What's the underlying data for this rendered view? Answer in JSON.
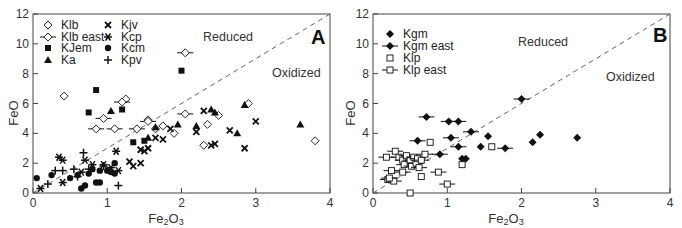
{
  "chart_data": [
    {
      "panel": "A",
      "type": "scatter",
      "title": "",
      "panel_label": "A",
      "xlabel": "Fe2O3",
      "ylabel": "FeO",
      "xlim": [
        0,
        4
      ],
      "ylim": [
        0,
        12
      ],
      "xticks": [
        "0",
        "1",
        "2",
        "3",
        "4"
      ],
      "yticks": [
        "0",
        "2",
        "4",
        "6",
        "8",
        "10",
        "12"
      ],
      "grid": false,
      "legend_position": "upper-left",
      "annotations": [
        {
          "text": "Reduced",
          "x": 2.3,
          "y": 10.6
        },
        {
          "text": "Oxidized",
          "x": 3.15,
          "y": 8.1
        }
      ],
      "reference_line": {
        "style": "dashed",
        "from": [
          0,
          0
        ],
        "to": [
          4,
          12
        ]
      },
      "series": [
        {
          "name": "Klb",
          "marker": "diamond-open",
          "points": [
            [
              0.42,
              6.5
            ],
            [
              1.25,
              6.3
            ],
            [
              1.55,
              4.9
            ],
            [
              1.65,
              4.3
            ],
            [
              1.75,
              4.5
            ],
            [
              1.9,
              4.0
            ],
            [
              2.35,
              4.6
            ],
            [
              2.5,
              5.2
            ],
            [
              2.3,
              3.2
            ],
            [
              2.9,
              6.0
            ],
            [
              3.8,
              3.5
            ]
          ]
        },
        {
          "name": "Klb east",
          "marker": "diamond-open-bar",
          "points": [
            [
              0.85,
              4.3
            ],
            [
              0.95,
              5.0
            ],
            [
              1.1,
              4.3
            ],
            [
              1.2,
              6.1
            ],
            [
              1.4,
              4.3
            ],
            [
              1.55,
              4.8
            ],
            [
              2.05,
              9.4
            ],
            [
              2.05,
              5.3
            ]
          ]
        },
        {
          "name": "KJem",
          "marker": "square-filled",
          "points": [
            [
              0.75,
              5.4
            ],
            [
              0.85,
              6.9
            ],
            [
              1.2,
              5.6
            ],
            [
              2.0,
              8.2
            ],
            [
              1.5,
              3.5
            ],
            [
              1.35,
              3.4
            ]
          ]
        },
        {
          "name": "Ka",
          "marker": "triangle-filled",
          "points": [
            [
              1.05,
              5.5
            ],
            [
              1.55,
              3.7
            ],
            [
              1.65,
              4.4
            ],
            [
              1.95,
              4.6
            ],
            [
              2.2,
              4.5
            ],
            [
              2.4,
              5.6
            ],
            [
              2.45,
              5.4
            ],
            [
              2.85,
              5.9
            ],
            [
              2.75,
              4.0
            ],
            [
              3.6,
              4.6
            ]
          ]
        },
        {
          "name": "Kjv",
          "marker": "x-bold",
          "points": [
            [
              1.3,
              2.1
            ],
            [
              1.35,
              1.8
            ],
            [
              1.45,
              2.0
            ],
            [
              1.45,
              2.9
            ],
            [
              1.5,
              2.8
            ],
            [
              1.55,
              3.0
            ],
            [
              1.65,
              3.7
            ],
            [
              1.75,
              3.6
            ],
            [
              1.85,
              4.3
            ],
            [
              2.2,
              4.1
            ],
            [
              2.3,
              5.5
            ],
            [
              2.45,
              3.3
            ],
            [
              2.4,
              3.2
            ],
            [
              2.65,
              4.2
            ],
            [
              2.85,
              3.0
            ],
            [
              3.0,
              4.8
            ]
          ]
        },
        {
          "name": "Kcp",
          "marker": "asterisk",
          "points": [
            [
              0.1,
              0.3
            ],
            [
              0.35,
              2.4
            ],
            [
              0.4,
              2.2
            ],
            [
              0.4,
              0.7
            ],
            [
              0.65,
              1.4
            ],
            [
              0.7,
              2.2
            ],
            [
              0.8,
              1.9
            ],
            [
              0.95,
              1.9
            ],
            [
              1.05,
              1.7
            ],
            [
              1.12,
              2.8
            ],
            [
              1.15,
              1.5
            ]
          ]
        },
        {
          "name": "Kcm",
          "marker": "circle-filled",
          "points": [
            [
              0.05,
              1.0
            ],
            [
              0.25,
              1.2
            ],
            [
              0.5,
              1.0
            ],
            [
              0.6,
              1.2
            ],
            [
              0.65,
              0.3
            ],
            [
              0.7,
              0.5
            ],
            [
              0.75,
              1.3
            ],
            [
              0.8,
              1.6
            ],
            [
              0.85,
              0.7
            ],
            [
              0.9,
              0.7
            ],
            [
              0.9,
              1.5
            ],
            [
              1.0,
              1.5
            ],
            [
              1.05,
              1.4
            ],
            [
              1.1,
              2.0
            ],
            [
              1.1,
              1.3
            ]
          ]
        },
        {
          "name": "Kpv",
          "marker": "plus",
          "points": [
            [
              0.2,
              0.6
            ],
            [
              0.3,
              1.5
            ],
            [
              0.4,
              1.5
            ],
            [
              0.55,
              1.6
            ],
            [
              0.68,
              2.7
            ],
            [
              0.6,
              1.1
            ],
            [
              1.15,
              0.5
            ],
            [
              0.75,
              1.6
            ],
            [
              0.95,
              1.8
            ]
          ]
        }
      ]
    },
    {
      "panel": "B",
      "type": "scatter",
      "title": "",
      "panel_label": "B",
      "xlabel": "Fe2O3",
      "ylabel": "FeO",
      "xlim": [
        0,
        4
      ],
      "ylim": [
        0,
        12
      ],
      "xticks": [
        "0",
        "1",
        "2",
        "3",
        "4"
      ],
      "yticks": [
        "0",
        "2",
        "4",
        "6",
        "8",
        "10",
        "12"
      ],
      "grid": false,
      "legend_position": "upper-left",
      "annotations": [
        {
          "text": "Reduced",
          "x": 2.15,
          "y": 10.4
        },
        {
          "text": "Oxidized",
          "x": 3.15,
          "y": 7.9
        }
      ],
      "reference_line": {
        "style": "dashed",
        "from": [
          0,
          0
        ],
        "to": [
          4,
          12
        ]
      },
      "series": [
        {
          "name": "Kgm",
          "marker": "diamond-filled",
          "points": [
            [
              1.2,
              2.3
            ],
            [
              1.25,
              2.3
            ],
            [
              1.45,
              3.1
            ],
            [
              1.55,
              3.8
            ],
            [
              2.15,
              3.4
            ],
            [
              2.25,
              3.9
            ],
            [
              2.75,
              3.7
            ]
          ]
        },
        {
          "name": "Kgm east",
          "marker": "diamond-filled-bar",
          "points": [
            [
              0.6,
              3.5
            ],
            [
              0.72,
              5.1
            ],
            [
              0.9,
              2.6
            ],
            [
              1.02,
              4.8
            ],
            [
              1.05,
              3.7
            ],
            [
              1.15,
              4.8
            ],
            [
              1.15,
              3.1
            ],
            [
              1.32,
              4.1
            ],
            [
              1.78,
              3.0
            ],
            [
              2.0,
              6.3
            ]
          ]
        },
        {
          "name": "Klp",
          "marker": "square-open",
          "points": [
            [
              0.5,
              0.0
            ],
            [
              0.65,
              1.1
            ],
            [
              0.77,
              3.4
            ],
            [
              1.2,
              1.9
            ],
            [
              1.6,
              3.1
            ]
          ]
        },
        {
          "name": "Klp east",
          "marker": "square-open-bar",
          "points": [
            [
              0.2,
              0.9
            ],
            [
              0.25,
              1.5
            ],
            [
              0.28,
              0.8
            ],
            [
              0.3,
              2.8
            ],
            [
              0.35,
              2.4
            ],
            [
              0.4,
              2.2
            ],
            [
              0.4,
              1.4
            ],
            [
              0.42,
              1.9
            ],
            [
              0.45,
              2.5
            ],
            [
              0.5,
              2.2
            ],
            [
              0.52,
              1.8
            ],
            [
              0.55,
              2.4
            ],
            [
              0.58,
              2.0
            ],
            [
              0.6,
              2.3
            ],
            [
              0.62,
              1.7
            ],
            [
              0.65,
              2.2
            ],
            [
              0.7,
              2.6
            ],
            [
              0.88,
              1.4
            ],
            [
              1.0,
              0.6
            ],
            [
              0.18,
              2.4
            ],
            [
              0.22,
              1.0
            ]
          ]
        }
      ]
    }
  ],
  "panels": {
    "a": {
      "letter": "A",
      "xlabel_main": "Fe",
      "xlabel_sub1": "2",
      "xlabel_mid": "O",
      "xlabel_sub2": "3",
      "ylabel": "FeO",
      "reduced": "Reduced",
      "oxidized": "Oxidized",
      "legend": [
        "Klb",
        "Klb east",
        "KJem",
        "Ka",
        "Kjv",
        "Kcp",
        "Kcm",
        "Kpv"
      ]
    },
    "b": {
      "letter": "B",
      "xlabel_main": "Fe",
      "xlabel_sub1": "2",
      "xlabel_mid": "O",
      "xlabel_sub2": "3",
      "ylabel": "FeO",
      "reduced": "Reduced",
      "oxidized": "Oxidized",
      "legend": [
        "Kgm",
        "Kgm east",
        "Klp",
        "Klp east"
      ]
    }
  }
}
